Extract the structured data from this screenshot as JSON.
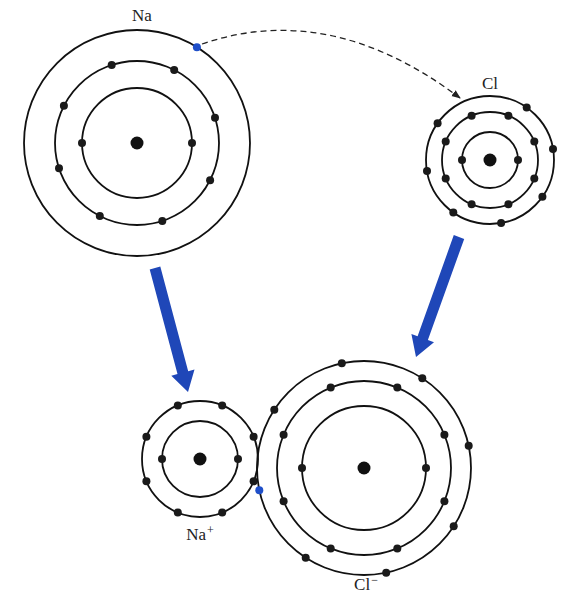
{
  "colors": {
    "shell": "#111111",
    "electron": "#1a1a1a",
    "nucleus": "#111111",
    "transferred_electron": "#1f4fc9",
    "arrow": "#1f47b8",
    "background": "#ffffff"
  },
  "atoms": [
    {
      "id": "na",
      "label": "Na",
      "charge": "",
      "cx": 137,
      "cy": 143,
      "shells": [
        {
          "r": 55,
          "electrons": 2,
          "start_deg": 0
        },
        {
          "r": 82,
          "electrons": 8,
          "start_deg": 27
        },
        {
          "r": 113,
          "electrons": 1,
          "start_deg": -58,
          "highlight": [
            0
          ]
        }
      ],
      "label_x": 142,
      "label_y": 6
    },
    {
      "id": "cl",
      "label": "Cl",
      "charge": "",
      "cx": 490,
      "cy": 160,
      "shells": [
        {
          "r": 28,
          "electrons": 2,
          "start_deg": 0
        },
        {
          "r": 48,
          "electrons": 8,
          "start_deg": 22.5
        },
        {
          "r": 64,
          "electrons": 7,
          "start_deg": -55,
          "skip_angle": -125
        }
      ],
      "label_x": 490,
      "label_y": 74
    },
    {
      "id": "na-plus",
      "label": "Na",
      "charge": "+",
      "cx": 200,
      "cy": 459,
      "shells": [
        {
          "r": 38,
          "electrons": 2,
          "start_deg": 0
        },
        {
          "r": 58,
          "electrons": 8,
          "start_deg": 22.5
        }
      ],
      "label_x": 200,
      "label_y": 523
    },
    {
      "id": "cl-minus",
      "label": "Cl",
      "charge": "−",
      "cx": 364,
      "cy": 468,
      "shells": [
        {
          "r": 62,
          "electrons": 2,
          "start_deg": 0
        },
        {
          "r": 87,
          "electrons": 8,
          "start_deg": 22.5
        },
        {
          "r": 107,
          "electrons": 8,
          "start_deg": -57,
          "highlight": [
            5
          ]
        }
      ],
      "label_x": 366,
      "label_y": 573
    }
  ],
  "transfer_arc": {
    "from": [
      202,
      44
    ],
    "control": [
      330,
      0
    ],
    "to": [
      460,
      98
    ],
    "style": "dashed"
  },
  "arrows": [
    {
      "id": "na-to-na-plus",
      "from": [
        155,
        268
      ],
      "to": [
        188,
        392
      ]
    },
    {
      "id": "cl-to-cl-minus",
      "from": [
        459,
        237
      ],
      "to": [
        416,
        357
      ]
    }
  ]
}
